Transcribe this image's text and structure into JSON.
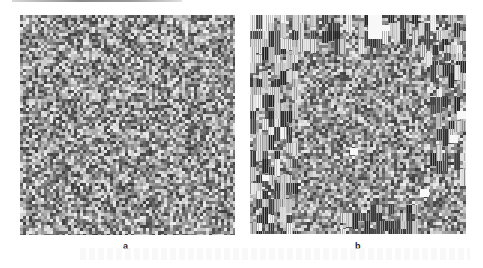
{
  "figure": {
    "panels": [
      {
        "id": "a",
        "label": "a",
        "description": "Uniform noise-like encrypted image",
        "noise_seed": 17,
        "block_regions": []
      },
      {
        "id": "b",
        "label": "b",
        "description": "Noise-like image with block/stripe artifacts along borders",
        "noise_seed": 91,
        "block_regions": [
          {
            "x": 0,
            "y": 0,
            "w": 216,
            "h": 30
          },
          {
            "x": 0,
            "y": 0,
            "w": 45,
            "h": 219
          },
          {
            "x": 170,
            "y": 30,
            "w": 46,
            "h": 20
          },
          {
            "x": 180,
            "y": 50,
            "w": 36,
            "h": 110
          },
          {
            "x": 90,
            "y": 190,
            "w": 80,
            "h": 29
          }
        ],
        "white_patches": [
          {
            "x": 118,
            "y": 0,
            "w": 14,
            "h": 24
          },
          {
            "x": 100,
            "y": 133,
            "w": 8,
            "h": 7
          },
          {
            "x": 12,
            "y": 160,
            "w": 7,
            "h": 6
          },
          {
            "x": 170,
            "y": 174,
            "w": 9,
            "h": 8
          },
          {
            "x": 200,
            "y": 120,
            "w": 8,
            "h": 8
          },
          {
            "x": 207,
            "y": 96,
            "w": 9,
            "h": 8
          },
          {
            "x": 130,
            "y": 10,
            "w": 10,
            "h": 6
          }
        ]
      }
    ],
    "colors": {
      "background": "#ffffff",
      "label": "#222222",
      "noise_light": "#e6e6e6",
      "noise_dark": "#3a3a3a"
    }
  }
}
